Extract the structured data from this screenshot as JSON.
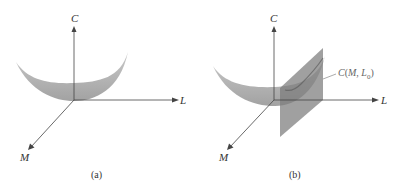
{
  "figure": {
    "panels": [
      {
        "id": "a",
        "caption": "(a)",
        "axes": {
          "vertical": "C",
          "horizontal": "L",
          "depth": "M"
        },
        "surface": "bowl-shaped cost surface C(M, L)"
      },
      {
        "id": "b",
        "caption": "(b)",
        "axes": {
          "vertical": "C",
          "horizontal": "L",
          "depth": "M"
        },
        "surface": "bowl-shaped cost surface C(M, L) cut by vertical plane L = L0",
        "annotation": {
          "prefix": "C",
          "args_open": "(",
          "arg1": "M",
          "sep": ", ",
          "arg2": "L",
          "arg2_sub": "0",
          "args_close": ")"
        }
      }
    ]
  },
  "colors": {
    "axis": "#444444",
    "surface": "#a8a8a8",
    "surface_dark": "#8a8a8a",
    "plane": "#7a7a7a",
    "label": "#333333",
    "annotation": "#666666"
  }
}
